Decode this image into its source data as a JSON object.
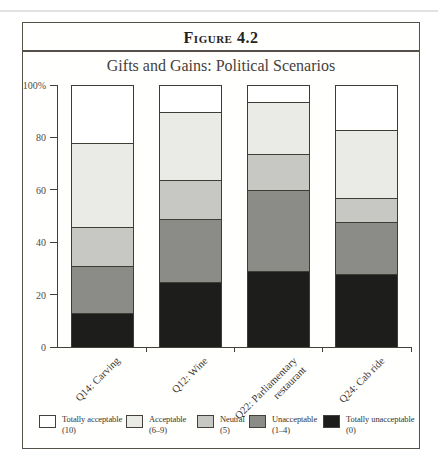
{
  "figure": {
    "label": "Figure 4.2",
    "title": "Gifts and Gains: Political Scenarios"
  },
  "chart_data": {
    "type": "bar",
    "stacked": true,
    "units": "percent",
    "title": "Gifts and Gains: Political Scenarios",
    "figure_label": "Figure 4.2",
    "categories": [
      "Q14: Carving",
      "Q12: Wine",
      "Q22: Parliamentary\nrestaurant",
      "Q24: Cab ride"
    ],
    "series": [
      {
        "name": "Totally acceptable",
        "range": "(10)",
        "color": "#ffffff",
        "values": [
          22,
          10,
          6,
          17
        ]
      },
      {
        "name": "Acceptable",
        "range": "(6–9)",
        "color": "#eaeae7",
        "values": [
          32,
          26,
          20,
          26
        ]
      },
      {
        "name": "Neutral",
        "range": "(5)",
        "color": "#c7c7c3",
        "values": [
          15,
          15,
          14,
          9
        ]
      },
      {
        "name": "Unacceptable",
        "range": "(1–4)",
        "color": "#8b8b87",
        "values": [
          18,
          24,
          31,
          20
        ]
      },
      {
        "name": "Totally unacceptable",
        "range": "(0)",
        "color": "#1d1d1b",
        "values": [
          13,
          25,
          29,
          28
        ]
      }
    ],
    "yticks": [
      {
        "v": 100,
        "label": "100%"
      },
      {
        "v": 80,
        "label": "80"
      },
      {
        "v": 60,
        "label": "60"
      },
      {
        "v": 40,
        "label": "40"
      },
      {
        "v": 20,
        "label": "20"
      },
      {
        "v": 0,
        "label": "0"
      }
    ],
    "ylim": [
      0,
      100
    ],
    "grid": false,
    "legend_position": "bottom"
  }
}
